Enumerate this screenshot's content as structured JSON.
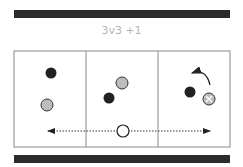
{
  "title": "3v3 +1",
  "colors": {
    "bar": "#2b2b2b",
    "field_line": "#8a8a8a",
    "team_dark": "#222222",
    "team_light": "#bdbdbd",
    "neutral": "#ffffff",
    "title": "#b5b5b5"
  },
  "field": {
    "zones": 3,
    "zone_labels": []
  },
  "players": [
    {
      "team": "dark",
      "zone": 1
    },
    {
      "team": "light",
      "zone": 1
    },
    {
      "team": "light",
      "zone": 2
    },
    {
      "team": "dark",
      "zone": 2
    },
    {
      "team": "dark",
      "zone": 3
    },
    {
      "team": "light",
      "zone": 3,
      "marker": "x"
    },
    {
      "team": "neutral",
      "zone": 2,
      "role": "+1 floater"
    }
  ],
  "annotations": {
    "rotation_arrow": "curved arrow in zone 3",
    "floater_movement": "dotted double-headed arrow across all zones"
  }
}
